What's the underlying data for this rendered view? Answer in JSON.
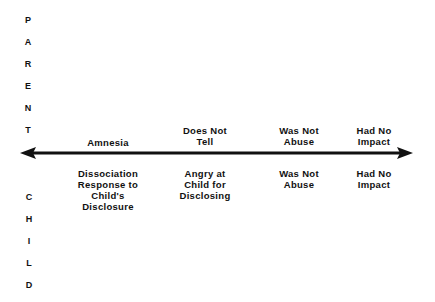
{
  "diagram": {
    "parent_axis_label": [
      "P",
      "A",
      "R",
      "E",
      "N",
      "T"
    ],
    "child_axis_label": [
      "C",
      "H",
      "I",
      "L",
      "D"
    ],
    "axis": {
      "type": "double-headed-arrow",
      "color": "#111111"
    },
    "parent_labels": [
      {
        "text": "Amnesia"
      },
      {
        "text": "Does Not\nTell"
      },
      {
        "text": "Was Not\nAbuse"
      },
      {
        "text": "Had No\nImpact"
      }
    ],
    "child_labels": [
      {
        "text": "Dissociation\nResponse to\nChild's\nDisclosure"
      },
      {
        "text": "Angry at\nChild for\nDisclosing"
      },
      {
        "text": "Was Not\nAbuse"
      },
      {
        "text": "Had No\nImpact"
      }
    ]
  }
}
